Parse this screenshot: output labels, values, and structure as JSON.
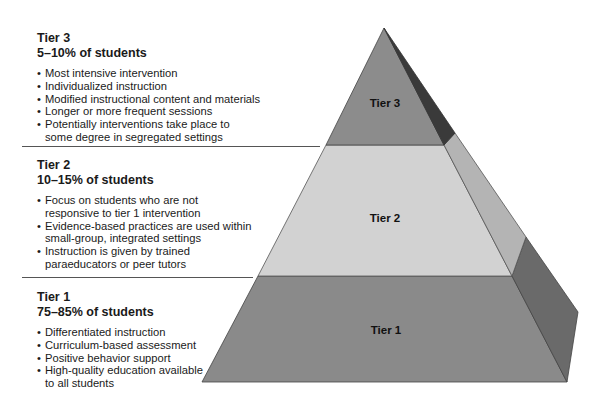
{
  "tiers": [
    {
      "label": "Tier 3",
      "percent": "5–10% of students",
      "bullets": [
        "Most intensive intervention",
        "Individualized instruction",
        "Modified instructional content and materials",
        "Longer or more frequent sessions",
        "Potentially interventions take place to some degree in segregated settings"
      ]
    },
    {
      "label": "Tier 2",
      "percent": "10–15% of students",
      "bullets": [
        "Focus on students who are not responsive to tier 1 intervention",
        "Evidence-based practices are used within small-group, integrated settings",
        "Instruction is given by trained paraeducators or peer tutors"
      ]
    },
    {
      "label": "Tier 1",
      "percent": "75–85% of students",
      "bullets": [
        "Differentiated instruction",
        "Curriculum-based assessment",
        "Positive behavior support",
        "High-quality education available to all students"
      ]
    }
  ],
  "pyramid": {
    "tier3_label": "Tier 3",
    "tier2_label": "Tier 2",
    "tier1_label": "Tier 1",
    "colors": {
      "tier3_front": "#8c8c8c",
      "tier3_side": "#3a3a3a",
      "tier2_front": "#d2d2d2",
      "tier2_side": "#b4b4b4",
      "tier1_front": "#8a8a8a",
      "tier1_side": "#6a6a6a"
    }
  }
}
